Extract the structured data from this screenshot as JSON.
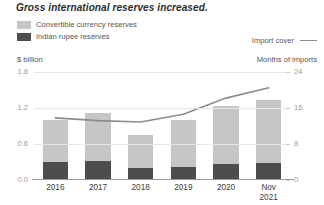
{
  "chart_data": {
    "type": "bar",
    "title": "Gross international reserves increased.",
    "categories": [
      "2016",
      "2017",
      "2018",
      "2019",
      "2020",
      "Nov 2021"
    ],
    "categories_display": [
      {
        "line1": "2016",
        "line2": ""
      },
      {
        "line1": "2017",
        "line2": ""
      },
      {
        "line1": "2018",
        "line2": ""
      },
      {
        "line1": "2019",
        "line2": ""
      },
      {
        "line1": "2020",
        "line2": ""
      },
      {
        "line1": "Nov",
        "line2": "2021"
      }
    ],
    "xlabel": "",
    "ylabel": "$ billion",
    "ylabel_right": "Months of imports",
    "ylim": [
      0.0,
      1.8
    ],
    "ylim_right": [
      0,
      24
    ],
    "yticks": [
      "0.0",
      "0.6",
      "1.2",
      "1.8"
    ],
    "yticks_right": [
      "0",
      "8",
      "16",
      "24"
    ],
    "grid": true,
    "legend_position": "top-left",
    "series": [
      {
        "name": "Convertible currency reserves",
        "type": "bar-segment",
        "color": "#c6c6c6",
        "values": [
          0.7,
          0.8,
          0.55,
          0.78,
          0.97,
          1.05
        ]
      },
      {
        "name": "Indian rupee reserves",
        "type": "bar-segment",
        "color": "#4d4d4d",
        "values": [
          0.3,
          0.32,
          0.2,
          0.22,
          0.26,
          0.28
        ]
      },
      {
        "name": "Import cover",
        "type": "line",
        "axis": "right",
        "color": "#8c8c8c",
        "values": [
          13.8,
          13.2,
          12.9,
          14.6,
          18.2,
          20.5
        ]
      }
    ],
    "bar_totals": [
      1.0,
      1.12,
      0.75,
      1.0,
      1.23,
      1.33
    ]
  },
  "legend": {
    "items": [
      {
        "label": "Convertible currency reserves",
        "color": "#c6c6c6"
      },
      {
        "label": "Indian rupee reserves",
        "color": "#4d4d4d"
      }
    ],
    "line_item": {
      "label": "Import cover",
      "color": "#8c8c8c"
    }
  }
}
